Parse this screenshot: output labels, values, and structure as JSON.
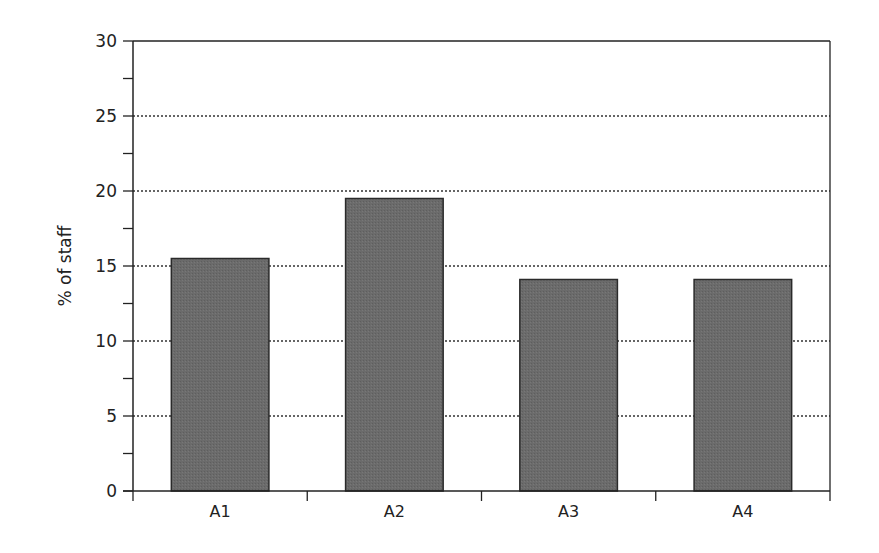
{
  "chart_data": {
    "type": "bar",
    "title": "",
    "xlabel": "",
    "ylabel": "% of staff",
    "categories": [
      "A1",
      "A2",
      "A3",
      "A4"
    ],
    "values": [
      15.5,
      19.5,
      14.1,
      14.1
    ],
    "ylim": [
      0,
      30
    ],
    "yticks": [
      0,
      5,
      10,
      15,
      20,
      25,
      30
    ],
    "yminor_step": 2.5,
    "grid": {
      "y": true,
      "style": "dotted"
    },
    "legend": null,
    "colors": {
      "bar_fill": "#6b6b6b",
      "bar_stroke": "#2a2a2a",
      "axis": "#222222",
      "grid": "#333333"
    }
  }
}
